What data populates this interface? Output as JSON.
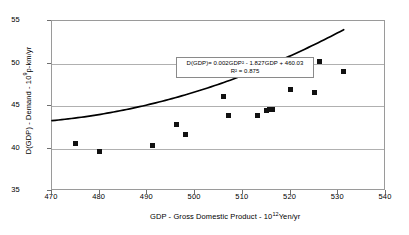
{
  "chart_data": {
    "type": "scatter",
    "title": "",
    "xlabel": "GDP - Gross Domestic Product - 10^12 Yen/yr",
    "xlabel_main": "GDP - Gross Domestic Product - 10",
    "xlabel_exponent": "12",
    "xlabel_tail": "Yen/yr",
    "ylabel": "D(GDP) - Demand - 10^9 p-km/yr",
    "ylabel_main": "D(GDP) - Demand - 10",
    "ylabel_exponent": "9",
    "ylabel_tail": "p-km/yr",
    "xlim": [
      470,
      540
    ],
    "ylim": [
      35,
      55
    ],
    "xticks": [
      470,
      480,
      490,
      500,
      510,
      520,
      530,
      540
    ],
    "yticks": [
      35,
      40,
      45,
      50,
      55
    ],
    "grid": "horizontal",
    "legend": "none",
    "marker_style": "filled-square",
    "marker_color": "#111111",
    "curve_color": "#000000",
    "points": [
      {
        "x": 475.0,
        "y": 40.6
      },
      {
        "x": 480.0,
        "y": 39.7
      },
      {
        "x": 491.0,
        "y": 40.4
      },
      {
        "x": 496.0,
        "y": 42.8
      },
      {
        "x": 498.0,
        "y": 41.7
      },
      {
        "x": 506.0,
        "y": 46.1
      },
      {
        "x": 507.0,
        "y": 43.9
      },
      {
        "x": 513.0,
        "y": 43.85
      },
      {
        "x": 515.0,
        "y": 44.5
      },
      {
        "x": 515.6,
        "y": 44.6
      },
      {
        "x": 516.2,
        "y": 44.65
      },
      {
        "x": 520.0,
        "y": 47.0
      },
      {
        "x": 525.0,
        "y": 46.65
      },
      {
        "x": 526.0,
        "y": 50.2
      },
      {
        "x": 531.0,
        "y": 49.1
      }
    ],
    "fit": {
      "type": "quadratic",
      "a": 0.002,
      "b": -1.827,
      "c": 460.03,
      "r_squared": 0.875,
      "equation_text": "D(GDP)= 0.002GDP² - 1.827GDP + 460.03",
      "r2_text": "R² = 0.875",
      "x_start": 470,
      "x_end": 531.5
    }
  },
  "annotations": {
    "equation_box": {
      "line1": "D(GDP)= 0.002GDP² - 1.827GDP + 460.03",
      "line2": "R² = 0.875"
    }
  }
}
